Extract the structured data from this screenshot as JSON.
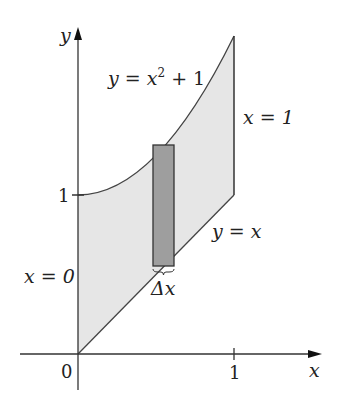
{
  "figure": {
    "type": "region-between-curves",
    "axes": {
      "x_label": "x",
      "y_label": "y",
      "origin_label": "0",
      "x_tick_label": "1",
      "y_tick_label": "1"
    },
    "curves": {
      "upper": {
        "label_lhs": "y = x",
        "label_exp": "2",
        "label_rhs": " + 1"
      },
      "lower": {
        "label": "y = x"
      },
      "left_bound": {
        "label": "x = 0"
      },
      "right_bound": {
        "label": "x = 1"
      }
    },
    "strip": {
      "width_label": "Δx"
    },
    "colors": {
      "region_fill": "#e6e6e6",
      "strip_fill": "#9e9e9e",
      "stroke": "#333333"
    }
  }
}
